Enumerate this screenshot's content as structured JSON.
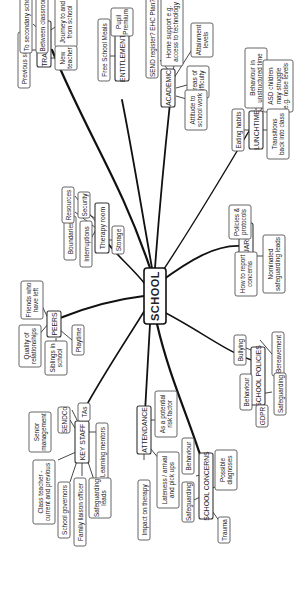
{
  "diagram": {
    "type": "mind-map",
    "orientation": "rotated-90-ccw",
    "root": {
      "id": "school",
      "label": "SCHOOL",
      "x": 155,
      "y": 296,
      "w": 22,
      "h": 56
    },
    "hubs": [
      {
        "id": "transitions",
        "label": "TRANSITIONS",
        "x": 44,
        "y": 50,
        "w": 14,
        "h": 50,
        "children": [
          {
            "id": "previous-schools",
            "label": "Previous schools",
            "x": 24,
            "y": 50,
            "w": 12,
            "h": 58
          },
          {
            "id": "to-secondary",
            "label": "To secondary school",
            "x": 24,
            "y": 122,
            "w": 12,
            "h": 70,
            "dummy": true
          },
          {
            "id": "between-classrooms",
            "label": "Between classrooms",
            "x": 44,
            "y": 0,
            "w": 12,
            "h": 0,
            "dummy": true
          },
          {
            "id": "journey",
            "label": "Journey to and from school",
            "x": 0,
            "y": 0,
            "w": 0,
            "h": 0,
            "dummy": true
          },
          {
            "id": "new-teacher",
            "label": "New teacher",
            "x": 0,
            "y": 0,
            "w": 0,
            "h": 0,
            "dummy": true
          }
        ]
      }
    ]
  },
  "nodes": {
    "school": "SCHOOL",
    "transitions": "TRANSITIONS",
    "previous_schools": "Previous schools",
    "to_secondary": "To secondary school",
    "between_classrooms": "Between classrooms",
    "journey": [
      "Journey to and",
      "from school"
    ],
    "new_teacher": [
      "New",
      "teacher"
    ],
    "entitlements": "ENTITLEMENTS",
    "free_school_meals": "Free School Meals",
    "pupil_premium": [
      "Pupil",
      "Premium"
    ],
    "academic": "ACADEMIC",
    "send_register": "SEND register? EHC Plan?",
    "home_support": [
      "Home support e.g.",
      "access to technology"
    ],
    "attainment": [
      "Attainment",
      "levels"
    ],
    "areas_difficulty": [
      "Areas of",
      "difficulty"
    ],
    "attitude": [
      "Attitude to",
      "school work"
    ],
    "lunchtime": "LUNCHTIME",
    "eating_habits": "Eating habits",
    "behaviour_unstructured": [
      "Behaviour in",
      "unstructured time"
    ],
    "asd_children": [
      "ASD children",
      "may struggle",
      "e.g. noise levels"
    ],
    "transitions_back": [
      "Transitions",
      "back into class"
    ],
    "therapy_room": "Therapy room",
    "boundaries": "Boundaries",
    "resources": "Resources",
    "security": "Security",
    "interruptions": "Interruptions",
    "storage": "Storage",
    "safeguarding_hub": "SAFEGUARDING",
    "policies_protocols": [
      "Policies &",
      "protocols"
    ],
    "how_to_report": [
      "How to report",
      "concerns"
    ],
    "nominated_leads": [
      "Nominated",
      "safeguarding leads"
    ],
    "peers": "PEERS",
    "friends_left": [
      "Friends who",
      "have left"
    ],
    "quality_relationships": [
      "Quality of",
      "relationships"
    ],
    "siblings": [
      "Siblings in",
      "school"
    ],
    "playtime": "Playtime",
    "school_policies": "SCHOOL POLICIES",
    "bullying": "Bullying",
    "bereavement": "Bereavement",
    "behaviour_policy": "Behaviour",
    "gdpr": "GDPR",
    "safeguarding_policy": "Safeguarding",
    "key_staff": "KEY STAFF",
    "senior_management": [
      "Senior",
      "management"
    ],
    "sendco": "SENDCo",
    "tas": "TAs",
    "learning_mentors": "Learning mentors",
    "class_teacher": [
      "Class teacher -",
      "current and previous"
    ],
    "school_governors": "School governors",
    "family_liaison": "Family liaison officer",
    "safeguarding_leads": [
      "Safeguarding",
      "leads"
    ],
    "attendance": "ATTENDANCE",
    "potential_risk": [
      "As a potential",
      "risk factor"
    ],
    "lateness": [
      "Lateness / arrival",
      "and pick ups"
    ],
    "impact_therapy": "Impact on therapy",
    "school_concerns": "SCHOOL CONCERNS",
    "behaviour_concern": "Behaviour",
    "possible_diagnoses": [
      "Possible",
      "diagnoses"
    ],
    "safeguarding_concern": "Safeguarding",
    "trauma": "Trauma"
  },
  "colors": {
    "background": "#ffffff",
    "main_branch": "#111111",
    "node_border": "#555555",
    "text": "#222222"
  }
}
